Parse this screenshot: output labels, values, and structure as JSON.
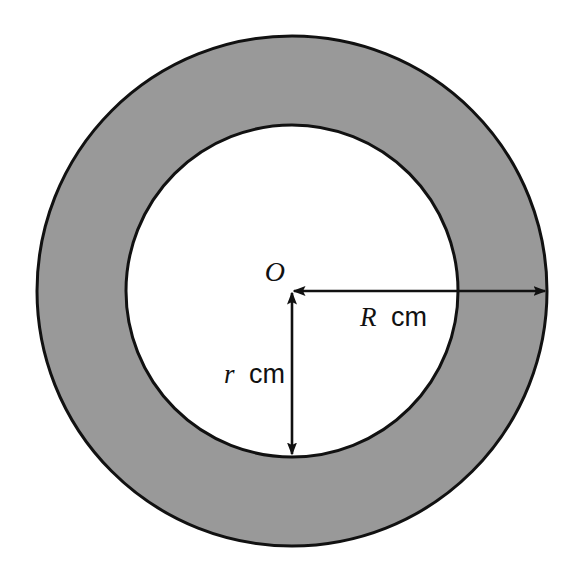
{
  "figure": {
    "kind": "annulus-diagram",
    "background_color": "#ffffff",
    "ring_fill_color": "#999999",
    "inner_fill_color": "#ffffff",
    "stroke_color": "#111111"
  },
  "geometry": {
    "center": {
      "x": 292,
      "y": 291
    },
    "outer_circle": {
      "radius": 255
    },
    "inner_circle": {
      "radius": 166
    },
    "stroke_width": 3
  },
  "labels": {
    "center": {
      "text": "O",
      "x": 285,
      "y": 281
    },
    "outer_radius": {
      "variable": "R",
      "unit": "cm",
      "full_text": "R cm",
      "x": 360,
      "y": 326
    },
    "inner_radius": {
      "variable": "r",
      "unit": "cm",
      "full_text": "r cm",
      "x": 224,
      "y": 383
    }
  },
  "arrows": {
    "outer_radius_arrow": {
      "name": "R-dimension-arrow",
      "orientation": "horizontal",
      "double_headed": true,
      "from": {
        "x": 292,
        "y": 291
      },
      "to": {
        "x": 547,
        "y": 291
      }
    },
    "inner_radius_arrow": {
      "name": "r-dimension-arrow",
      "orientation": "vertical",
      "double_headed": true,
      "from": {
        "x": 292,
        "y": 291
      },
      "to": {
        "x": 292,
        "y": 456
      }
    }
  }
}
